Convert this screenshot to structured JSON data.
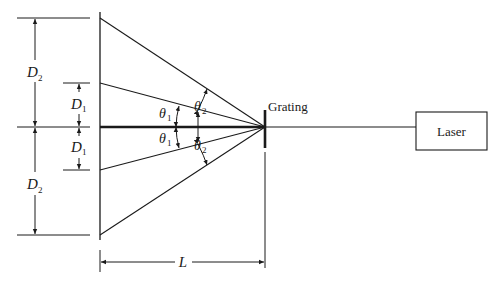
{
  "diagram": {
    "type": "diffraction-grating-setup",
    "labels": {
      "grating": "Grating",
      "laser": "Laser",
      "distance": "L",
      "d1_symbol": "D",
      "d1_subscript": "1",
      "d2_symbol": "D",
      "d2_subscript": "2",
      "theta_symbol": "θ",
      "theta1_subscript": "1",
      "theta2_subscript": "2"
    },
    "colors": {
      "line": "#1a1a1a",
      "background": "#ffffff"
    }
  }
}
